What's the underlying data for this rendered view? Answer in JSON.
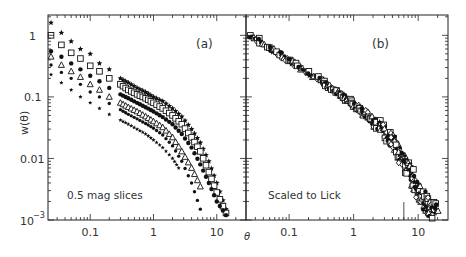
{
  "chart_data": [
    {
      "type": "scatter",
      "panel": "(a)",
      "annotation": "0.5 mag slices",
      "xlabel": "θ",
      "ylabel": "w(θ)",
      "xscale": "log",
      "yscale": "log",
      "xlim": [
        0.0215,
        29
      ],
      "ylim": [
        0.001,
        2.14
      ],
      "xticks": [
        "0.1",
        "1",
        "10"
      ],
      "yticks": [
        "1",
        "0.1",
        "0.01",
        "10^-3"
      ],
      "series": [
        {
          "name": "slice 1",
          "marker": "star",
          "x": [
            0.024,
            0.035,
            0.05,
            0.07,
            0.1,
            0.14,
            0.2,
            0.3,
            0.4,
            0.55,
            0.75,
            1.0,
            1.4,
            2.0,
            2.8,
            4.0,
            5.5,
            7.5,
            10,
            14
          ],
          "y": [
            1.6,
            1.1,
            0.8,
            0.6,
            0.5,
            0.35,
            0.28,
            0.2,
            0.17,
            0.14,
            0.12,
            0.1,
            0.085,
            0.065,
            0.048,
            0.03,
            0.018,
            0.009,
            0.004,
            0.0015
          ]
        },
        {
          "name": "slice 2",
          "marker": "square",
          "x": [
            0.024,
            0.035,
            0.05,
            0.07,
            0.1,
            0.14,
            0.2,
            0.3,
            0.4,
            0.55,
            0.75,
            1.0,
            1.4,
            2.0,
            2.8,
            4.0,
            5.5,
            7.5,
            10,
            14
          ],
          "y": [
            1.0,
            0.7,
            0.52,
            0.42,
            0.32,
            0.26,
            0.2,
            0.16,
            0.13,
            0.11,
            0.095,
            0.08,
            0.065,
            0.05,
            0.036,
            0.022,
            0.013,
            0.006,
            0.0028,
            0.0013
          ]
        },
        {
          "name": "slice 3",
          "marker": "filled-circle",
          "x": [
            0.024,
            0.035,
            0.05,
            0.07,
            0.1,
            0.14,
            0.2,
            0.3,
            0.4,
            0.55,
            0.75,
            1.0,
            1.4,
            2.0,
            2.8,
            4.0,
            5.5,
            7.5,
            10,
            14
          ],
          "y": [
            0.55,
            0.45,
            0.35,
            0.28,
            0.22,
            0.18,
            0.14,
            0.11,
            0.095,
            0.08,
            0.068,
            0.058,
            0.047,
            0.036,
            0.025,
            0.015,
            0.008,
            0.004,
            0.002,
            0.0012
          ]
        },
        {
          "name": "slice 4",
          "marker": "triangle",
          "x": [
            0.024,
            0.035,
            0.05,
            0.07,
            0.1,
            0.14,
            0.2,
            0.3,
            0.4,
            0.55,
            0.75,
            1.0,
            1.4,
            2.0,
            2.8,
            4.0,
            5.5
          ],
          "y": [
            0.45,
            0.33,
            0.26,
            0.21,
            0.16,
            0.13,
            0.1,
            0.08,
            0.068,
            0.058,
            0.048,
            0.04,
            0.032,
            0.022,
            0.013,
            0.007,
            0.0035
          ]
        },
        {
          "name": "slice 5",
          "marker": "dot",
          "x": [
            0.024,
            0.035,
            0.05,
            0.07,
            0.1,
            0.14,
            0.2,
            0.3,
            0.4,
            0.55,
            0.75,
            1.0,
            1.4,
            2.0,
            2.8,
            4.0,
            5.5
          ],
          "y": [
            0.33,
            0.25,
            0.2,
            0.16,
            0.12,
            0.1,
            0.078,
            0.062,
            0.052,
            0.044,
            0.037,
            0.031,
            0.024,
            0.016,
            0.009,
            0.004,
            0.0015
          ]
        },
        {
          "name": "slice 6",
          "marker": "small-star",
          "x": [
            0.024,
            0.035,
            0.05,
            0.07,
            0.1,
            0.14,
            0.2,
            0.3,
            0.4,
            0.55,
            0.75,
            1.0,
            1.4,
            2.0,
            2.5
          ],
          "y": [
            0.23,
            0.17,
            0.13,
            0.1,
            0.08,
            0.065,
            0.052,
            0.042,
            0.036,
            0.03,
            0.025,
            0.02,
            0.015,
            0.01,
            0.007
          ]
        }
      ]
    },
    {
      "type": "scatter",
      "panel": "(b)",
      "annotation": "Scaled to Lick",
      "xlabel": "θ",
      "xscale": "log",
      "yscale": "log",
      "xlim": [
        0.0215,
        29
      ],
      "ylim": [
        0.001,
        2.14
      ],
      "xticks": [
        "0.1",
        "1",
        "10"
      ],
      "description": "All six magnitude slices rescaled onto a single curve; w(θ)≈1 at θ≈0.025 falling as a power law to ~0.1 at θ≈0.7, steepening to ~0.001 near θ≈20.",
      "series": [
        {
          "name": "scaled (all slices)",
          "marker": "mixed",
          "x": [
            0.025,
            0.035,
            0.05,
            0.07,
            0.1,
            0.14,
            0.2,
            0.3,
            0.4,
            0.55,
            0.75,
            1.0,
            1.4,
            2.0,
            2.8,
            4.0,
            5.5,
            7.5,
            10,
            14,
            20
          ],
          "y": [
            1.0,
            0.8,
            0.62,
            0.5,
            0.4,
            0.32,
            0.25,
            0.19,
            0.15,
            0.12,
            0.095,
            0.075,
            0.058,
            0.042,
            0.03,
            0.019,
            0.011,
            0.006,
            0.003,
            0.0016,
            0.0011
          ]
        }
      ]
    }
  ],
  "panels": {
    "a": {
      "label": "(a)",
      "annotation": "0.5 mag slices"
    },
    "b": {
      "label": "(b)",
      "annotation": "Scaled to Lick"
    }
  },
  "axes": {
    "ylabel": "w(θ)",
    "xlabel": "θ",
    "ytick_labels": {
      "one": "1",
      "tenth": "0.1",
      "hundredth": "0.01",
      "thousandth_base": "10",
      "thousandth_exp": "−3"
    },
    "xtick_labels": [
      "0.1",
      "1",
      "10"
    ]
  }
}
